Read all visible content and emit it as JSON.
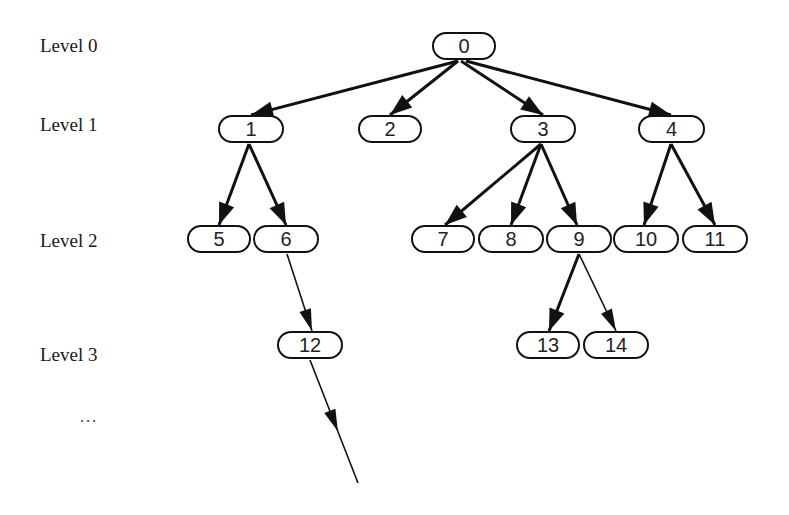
{
  "diagram": {
    "type": "tree",
    "levels": [
      {
        "label": "Level 0",
        "x": 40,
        "y": 36
      },
      {
        "label": "Level 1",
        "x": 40,
        "y": 115
      },
      {
        "label": "Level 2",
        "x": 40,
        "y": 231
      },
      {
        "label": "Level 3",
        "x": 40,
        "y": 345
      }
    ],
    "ellipsis": {
      "label": "...",
      "x": 80,
      "y": 408
    },
    "nodes": [
      {
        "id": "0",
        "label": "0",
        "x": 432,
        "y": 32,
        "w": 60
      },
      {
        "id": "1",
        "label": "1",
        "x": 218,
        "y": 115,
        "w": 62
      },
      {
        "id": "2",
        "label": "2",
        "x": 358,
        "y": 115,
        "w": 60
      },
      {
        "id": "3",
        "label": "3",
        "x": 510,
        "y": 115,
        "w": 62
      },
      {
        "id": "4",
        "label": "4",
        "x": 638,
        "y": 115,
        "w": 63
      },
      {
        "id": "5",
        "label": "5",
        "x": 187,
        "y": 225,
        "w": 60
      },
      {
        "id": "6",
        "label": "6",
        "x": 253,
        "y": 225,
        "w": 62
      },
      {
        "id": "7",
        "label": "7",
        "x": 411,
        "y": 225,
        "w": 60
      },
      {
        "id": "8",
        "label": "8",
        "x": 478,
        "y": 225,
        "w": 62
      },
      {
        "id": "9",
        "label": "9",
        "x": 546,
        "y": 225,
        "w": 62
      },
      {
        "id": "10",
        "label": "10",
        "x": 613,
        "y": 225,
        "w": 62
      },
      {
        "id": "11",
        "label": "11",
        "x": 682,
        "y": 225,
        "w": 62
      },
      {
        "id": "12",
        "label": "12",
        "x": 277,
        "y": 331,
        "w": 62
      },
      {
        "id": "13",
        "label": "13",
        "x": 516,
        "y": 331,
        "w": 60
      },
      {
        "id": "14",
        "label": "14",
        "x": 583,
        "y": 331,
        "w": 62
      }
    ],
    "edges": [
      {
        "from": "0",
        "to": "1",
        "x1": 458,
        "y1": 61,
        "x2": 251,
        "y2": 115,
        "weight": "thick"
      },
      {
        "from": "0",
        "to": "2",
        "x1": 458,
        "y1": 61,
        "x2": 390,
        "y2": 115,
        "weight": "thick"
      },
      {
        "from": "0",
        "to": "3",
        "x1": 461,
        "y1": 61,
        "x2": 543,
        "y2": 115,
        "weight": "thick"
      },
      {
        "from": "0",
        "to": "4",
        "x1": 466,
        "y1": 61,
        "x2": 671,
        "y2": 115,
        "weight": "thick"
      },
      {
        "from": "1",
        "to": "5",
        "x1": 249,
        "y1": 144,
        "x2": 219,
        "y2": 225,
        "weight": "thick"
      },
      {
        "from": "1",
        "to": "6",
        "x1": 249,
        "y1": 144,
        "x2": 286,
        "y2": 225,
        "weight": "thick"
      },
      {
        "from": "3",
        "to": "7",
        "x1": 541,
        "y1": 144,
        "x2": 445,
        "y2": 225,
        "weight": "thick"
      },
      {
        "from": "3",
        "to": "8",
        "x1": 541,
        "y1": 144,
        "x2": 511,
        "y2": 225,
        "weight": "thick"
      },
      {
        "from": "3",
        "to": "9",
        "x1": 541,
        "y1": 144,
        "x2": 577,
        "y2": 225,
        "weight": "thick"
      },
      {
        "from": "4",
        "to": "10",
        "x1": 671,
        "y1": 144,
        "x2": 644,
        "y2": 225,
        "weight": "thick"
      },
      {
        "from": "4",
        "to": "11",
        "x1": 671,
        "y1": 144,
        "x2": 715,
        "y2": 225,
        "weight": "thick"
      },
      {
        "from": "6",
        "to": "12",
        "x1": 287,
        "y1": 254,
        "x2": 312,
        "y2": 331,
        "weight": "thin"
      },
      {
        "from": "9",
        "to": "13",
        "x1": 579,
        "y1": 254,
        "x2": 549,
        "y2": 331,
        "weight": "thick"
      },
      {
        "from": "9",
        "to": "14",
        "x1": 579,
        "y1": 254,
        "x2": 616,
        "y2": 331,
        "weight": "thin"
      },
      {
        "from": "12",
        "to": "...",
        "x1": 310,
        "y1": 360,
        "x2": 358,
        "y2": 483,
        "weight": "thin",
        "arrow_mid": true
      }
    ]
  }
}
